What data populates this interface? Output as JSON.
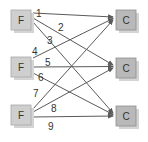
{
  "diagram": {
    "sources": [
      {
        "id": "f1",
        "label": "F"
      },
      {
        "id": "f2",
        "label": "F"
      },
      {
        "id": "f3",
        "label": "F"
      }
    ],
    "targets": [
      {
        "id": "c1",
        "label": "C"
      },
      {
        "id": "c2",
        "label": "C"
      },
      {
        "id": "c3",
        "label": "C"
      }
    ],
    "edges": [
      {
        "label": "1",
        "from": "f1",
        "to": "c1"
      },
      {
        "label": "2",
        "from": "f1",
        "to": "c2"
      },
      {
        "label": "3",
        "from": "f1",
        "to": "c3"
      },
      {
        "label": "4",
        "from": "f2",
        "to": "c1"
      },
      {
        "label": "5",
        "from": "f2",
        "to": "c2"
      },
      {
        "label": "6",
        "from": "f2",
        "to": "c3"
      },
      {
        "label": "7",
        "from": "f3",
        "to": "c1"
      },
      {
        "label": "8",
        "from": "f3",
        "to": "c2"
      },
      {
        "label": "9",
        "from": "f3",
        "to": "c3"
      }
    ],
    "colors": {
      "source_fill": "#cfcfcf",
      "target_fill": "#b9b9b9",
      "shadow": "#d4d4d4",
      "edge": "#5a5a5a"
    }
  }
}
